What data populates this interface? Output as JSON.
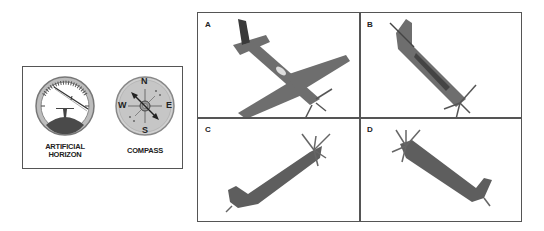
{
  "instruments": {
    "artificial_horizon": {
      "label_line1": "ARTIFICIAL",
      "label_line2": "HORIZON"
    },
    "compass": {
      "label": "COMPASS",
      "directions": {
        "north": "N",
        "south": "S",
        "east": "E",
        "west": "W"
      }
    }
  },
  "options": [
    {
      "label": "A",
      "description": "airplane viewed from below, nose toward lower right, banked"
    },
    {
      "label": "B",
      "description": "airplane viewed from side, nose pointing down toward lower right"
    },
    {
      "label": "C",
      "description": "airplane viewed from side, nose pointing up toward upper right"
    },
    {
      "label": "D",
      "description": "airplane viewed from side, nose pointing up toward upper left"
    }
  ],
  "colors": {
    "border": "#555555",
    "plane": "#6e6e6e",
    "dial_face": "#c8c8c8"
  }
}
